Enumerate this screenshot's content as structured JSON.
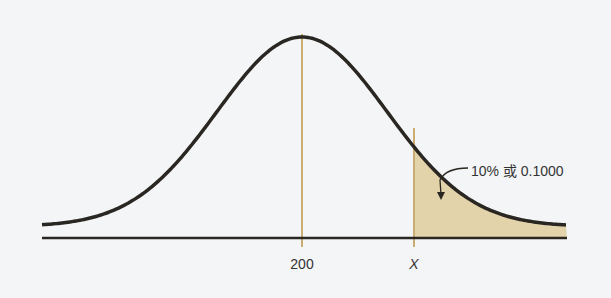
{
  "chart_data": {
    "type": "area",
    "title": "",
    "distribution": {
      "mean": 200,
      "mean_label": "200",
      "x_label": "X"
    },
    "shaded_region": {
      "from": "X",
      "to": "+inf",
      "probability_label": "10% 或 0.1000",
      "probability": 0.1
    },
    "tick_labels": [
      "200",
      "X"
    ],
    "xlabel": "",
    "ylabel": "",
    "grid": false,
    "colors": {
      "curve": "#2a2622",
      "shade": "#e3d3aa",
      "vline": "#c9ad72",
      "axis": "#2a2622"
    }
  },
  "labels": {
    "mean": "200",
    "x": "X",
    "annotation": "10% 或 0.1000"
  }
}
